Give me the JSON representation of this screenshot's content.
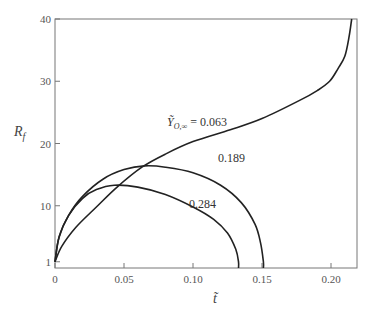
{
  "chart_data": {
    "type": "line",
    "title": "",
    "xlabel": "t̃",
    "ylabel": "R_f",
    "xlim": [
      0,
      0.22
    ],
    "ylim": [
      0,
      40
    ],
    "grid": false,
    "legend": "inline curve labels",
    "x_ticks": [
      "0",
      "0.05",
      "0.10",
      "0.15",
      "0.20"
    ],
    "y_ticks": [
      "1",
      "10",
      "20",
      "30",
      "40"
    ],
    "series": [
      {
        "name": "Ỹ_O,∞ = 0.063",
        "label": "0.063",
        "points": [
          [
            0,
            1
          ],
          [
            0.005,
            3.5
          ],
          [
            0.015,
            6.5
          ],
          [
            0.03,
            9.8
          ],
          [
            0.045,
            13
          ],
          [
            0.063,
            16.2
          ],
          [
            0.08,
            18.3
          ],
          [
            0.1,
            20.3
          ],
          [
            0.127,
            22.2
          ],
          [
            0.15,
            24
          ],
          [
            0.178,
            27
          ],
          [
            0.19,
            28.5
          ],
          [
            0.199,
            30
          ],
          [
            0.205,
            32
          ],
          [
            0.21,
            34
          ],
          [
            0.213,
            37
          ],
          [
            0.215,
            40
          ]
        ]
      },
      {
        "name": "0.189",
        "label": "0.189",
        "points": [
          [
            0,
            1
          ],
          [
            0.003,
            5
          ],
          [
            0.01,
            8.5
          ],
          [
            0.02,
            11.5
          ],
          [
            0.035,
            14.3
          ],
          [
            0.05,
            15.8
          ],
          [
            0.065,
            16.4
          ],
          [
            0.08,
            16.2
          ],
          [
            0.1,
            15.3
          ],
          [
            0.12,
            13.3
          ],
          [
            0.135,
            10.5
          ],
          [
            0.145,
            7
          ],
          [
            0.149,
            4
          ],
          [
            0.151,
            1
          ],
          [
            0.151,
            0
          ]
        ]
      },
      {
        "name": "0.284",
        "label": "0.284",
        "points": [
          [
            0,
            1
          ],
          [
            0.003,
            5
          ],
          [
            0.01,
            8.5
          ],
          [
            0.02,
            11.2
          ],
          [
            0.03,
            12.6
          ],
          [
            0.043,
            13.3
          ],
          [
            0.06,
            13
          ],
          [
            0.08,
            11.8
          ],
          [
            0.1,
            9.8
          ],
          [
            0.115,
            7.8
          ],
          [
            0.125,
            5.6
          ],
          [
            0.131,
            3
          ],
          [
            0.133,
            1
          ],
          [
            0.133,
            0
          ]
        ]
      }
    ],
    "annotations": [
      {
        "text": "Ỹ_O,∞ = 0.063",
        "x": 0.082,
        "y": 22.2
      },
      {
        "text": "0.189",
        "x": 0.118,
        "y": 17.3
      },
      {
        "text": "0.284",
        "x": 0.097,
        "y": 12.6
      }
    ]
  },
  "axes": {
    "x_title": "t̃",
    "y_title_main": "R",
    "y_title_sub": "f"
  },
  "labels": {
    "curve_063_prefix": "Ỹ",
    "curve_063_sub": "O,∞",
    "curve_063_value": "= 0.063",
    "curve_189": "0.189",
    "curve_284": "0.284"
  }
}
